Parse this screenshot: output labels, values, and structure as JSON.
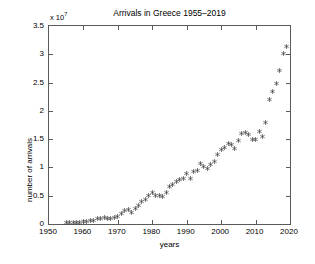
{
  "chart_data": {
    "type": "scatter",
    "title": "Arrivals in Greece 1955–2019",
    "xlabel": "years",
    "ylabel": "number of arrivals",
    "y_exponent_label": "x 10",
    "y_exponent_power": "7",
    "y_scale": 10000000.0,
    "xlim": [
      1950,
      2020
    ],
    "ylim": [
      0,
      35000000
    ],
    "xticks": [
      1950,
      1960,
      1970,
      1980,
      1990,
      2000,
      2010,
      2020
    ],
    "xticklabels": [
      "1950",
      "1960",
      "1970",
      "1980",
      "1990",
      "2000",
      "2010",
      "2020"
    ],
    "yticks": [
      0,
      5000000,
      10000000,
      15000000,
      20000000,
      25000000,
      30000000,
      35000000
    ],
    "yticklabels": [
      "0",
      "0.5",
      "1",
      "1.5",
      "2",
      "2.5",
      "3",
      "3.5"
    ],
    "grid": false,
    "legend": null,
    "marker": "asterisk",
    "marker_color": "#3a3a3a",
    "series": [
      {
        "name": "Arrivals in Greece",
        "x": [
          1955,
          1956,
          1957,
          1958,
          1959,
          1960,
          1961,
          1962,
          1963,
          1964,
          1965,
          1966,
          1967,
          1968,
          1969,
          1970,
          1971,
          1972,
          1973,
          1974,
          1975,
          1976,
          1977,
          1978,
          1979,
          1980,
          1981,
          1982,
          1983,
          1984,
          1985,
          1986,
          1987,
          1988,
          1989,
          1990,
          1991,
          1992,
          1993,
          1994,
          1995,
          1996,
          1997,
          1998,
          1999,
          2000,
          2001,
          2002,
          2003,
          2004,
          2005,
          2006,
          2007,
          2008,
          2009,
          2010,
          2011,
          2012,
          2013,
          2014,
          2015,
          2016,
          2017,
          2018,
          2019
        ],
        "y": [
          180000,
          220000,
          260000,
          300000,
          340000,
          400000,
          500000,
          580000,
          700000,
          900000,
          1000000,
          1100000,
          1000000,
          950000,
          1100000,
          1400000,
          1800000,
          2300000,
          2600000,
          2000000,
          2800000,
          3300000,
          3900000,
          4400000,
          5100000,
          5500000,
          5100000,
          5100000,
          4800000,
          5500000,
          6600000,
          7000000,
          7500000,
          7900000,
          8100000,
          8900000,
          8000000,
          9300000,
          9400000,
          10700000,
          10100000,
          9800000,
          10600000,
          11100000,
          12200000,
          13100000,
          13500000,
          14200000,
          14000000,
          13300000,
          14800000,
          16000000,
          16200000,
          15900000,
          14900000,
          15000000,
          16400000,
          15500000,
          17900000,
          22000000,
          23500000,
          24800000,
          27200000,
          30100000,
          31300000
        ]
      }
    ]
  }
}
